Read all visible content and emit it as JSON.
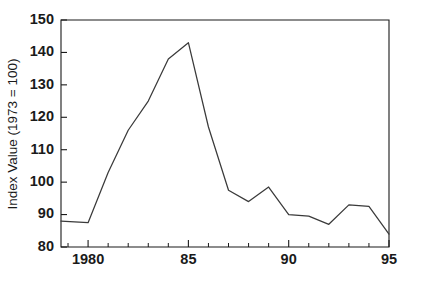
{
  "chart_data": {
    "type": "line",
    "title": "",
    "xlabel": "",
    "ylabel": "Index Value (1973 = 100)",
    "xlim": [
      1978.65,
      1995
    ],
    "ylim": [
      80,
      150
    ],
    "grid": false,
    "legend": null,
    "y_ticks": [
      80,
      90,
      100,
      110,
      120,
      130,
      140,
      150
    ],
    "y_tick_labels": [
      "80",
      "90",
      "100",
      "110",
      "120",
      "130",
      "140",
      "150"
    ],
    "x_ticks": [
      1979,
      1980,
      1981,
      1982,
      1983,
      1984,
      1985,
      1986,
      1987,
      1988,
      1989,
      1990,
      1991,
      1992,
      1993,
      1994,
      1995
    ],
    "x_major_ticks": [
      1980,
      1985,
      1990,
      1995
    ],
    "x_tick_labels": [
      "1980",
      "85",
      "90",
      "95"
    ],
    "series": [
      {
        "name": "Index Value",
        "x": [
          1978.65,
          1980,
          1981,
          1982,
          1983,
          1984,
          1985,
          1986,
          1987,
          1988,
          1989,
          1990,
          1991,
          1992,
          1993,
          1994,
          1995
        ],
        "values": [
          88.0,
          87.5,
          103.0,
          116.0,
          125.0,
          138.0,
          143.0,
          117.0,
          97.5,
          94.0,
          98.5,
          90.0,
          89.5,
          87.0,
          93.0,
          92.5,
          84.0
        ]
      }
    ]
  },
  "axis": {
    "y_title": "Index Value (1973 = 100)"
  }
}
